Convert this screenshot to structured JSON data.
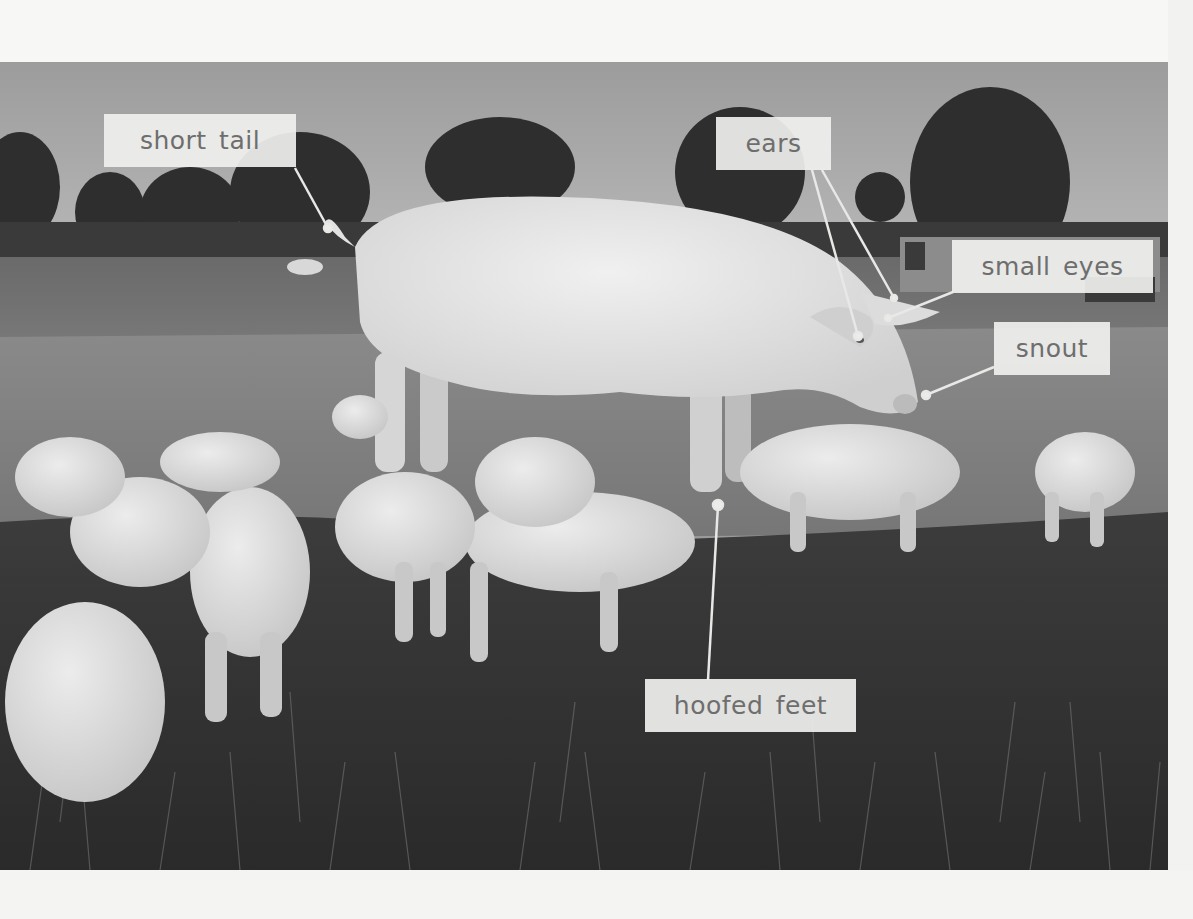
{
  "figure": {
    "color_mode": "grayscale",
    "labels": [
      {
        "id": "short-tail",
        "text": "short tail"
      },
      {
        "id": "ears",
        "text": "ears"
      },
      {
        "id": "small-eyes",
        "text": "small eyes"
      },
      {
        "id": "snout",
        "text": "snout"
      },
      {
        "id": "hoofed-feet",
        "text": "hoofed feet"
      }
    ],
    "colors": {
      "label_background": "#f0f0ee",
      "label_text": "#6e6e6e",
      "leader_line": "#e8e8e6",
      "page_background": "#f7f7f5"
    }
  }
}
